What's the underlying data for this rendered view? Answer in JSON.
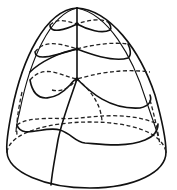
{
  "figure": {
    "colors": {
      "background": "#ffffff",
      "stroke": "#111111"
    },
    "nodes": [
      {
        "name": "apex",
        "x": 77,
        "y": 8
      },
      {
        "name": "node-1",
        "x": 77,
        "y": 24
      },
      {
        "name": "node-2",
        "x": 77,
        "y": 49
      },
      {
        "name": "node-3",
        "x": 77,
        "y": 79
      }
    ]
  }
}
